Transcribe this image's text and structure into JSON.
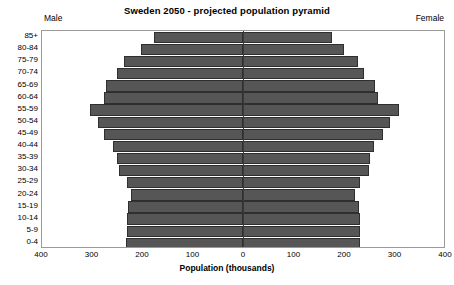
{
  "chart": {
    "title": "Sweden 2050 - projected population pyramid",
    "side_label_left": "Male",
    "side_label_right": "Female",
    "xaxis_title": "Population (thousands)",
    "bar_color": "#565656",
    "bar_border_color": "#2f2f2f",
    "frame_color": "#9a9a9a"
  },
  "chart_data": {
    "type": "bar",
    "subtype": "population-pyramid",
    "title": "Sweden 2050 - projected population pyramid",
    "xlabel": "Population (thousands)",
    "ylabel": "",
    "orientation": "horizontal",
    "grid": false,
    "legend": "none",
    "xlim": [
      -400,
      400
    ],
    "xticks": [
      -400,
      -300,
      -200,
      -100,
      0,
      100,
      200,
      300,
      400
    ],
    "xticklabels": [
      "400",
      "300",
      "200",
      "100",
      "0",
      "100",
      "200",
      "300",
      "400"
    ],
    "categories": [
      "85+",
      "80-84",
      "75-79",
      "70-74",
      "65-69",
      "60-64",
      "55-59",
      "50-54",
      "45-49",
      "40-44",
      "35-39",
      "30-34",
      "25-29",
      "20-24",
      "15-19",
      "10-14",
      "5-9",
      "0-4"
    ],
    "series": [
      {
        "name": "Male",
        "side": "left",
        "values": [
          178,
          203,
          236,
          250,
          272,
          277,
          304,
          288,
          276,
          258,
          251,
          247,
          230,
          222,
          229,
          231,
          230,
          232
        ]
      },
      {
        "name": "Female",
        "side": "right",
        "values": [
          177,
          200,
          228,
          241,
          263,
          268,
          310,
          292,
          278,
          260,
          253,
          250,
          233,
          223,
          231,
          233,
          232,
          233
        ]
      }
    ]
  }
}
